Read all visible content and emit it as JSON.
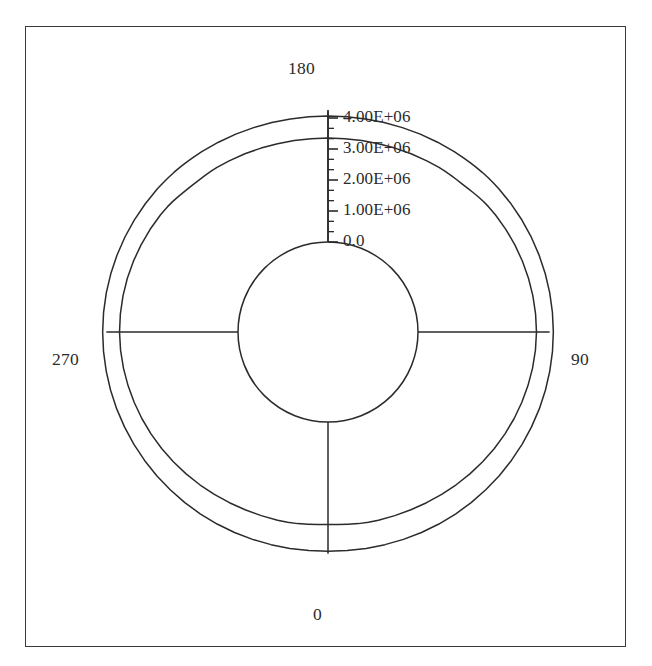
{
  "figure": {
    "type": "polar-plot",
    "background_color": "#ffffff",
    "line_color": "#2b2b2b",
    "frame_color": "#3a3a3a",
    "width": 652,
    "height": 666
  },
  "angular_axis": {
    "labels": [
      {
        "name": "angle-0",
        "text": "0",
        "angle_deg": 0
      },
      {
        "name": "angle-90",
        "text": "90",
        "angle_deg": 90
      },
      {
        "name": "angle-180",
        "text": "180",
        "angle_deg": 180
      },
      {
        "name": "angle-270",
        "text": "270",
        "angle_deg": 270
      }
    ],
    "direction": "clockwise_from_bottom",
    "spoke_count": 4
  },
  "radial_axis": {
    "labels": [
      "0.0",
      "1.00E+06",
      "2.00E+06",
      "3.00E+06",
      "4.00E+06"
    ],
    "values": [
      0,
      1000000,
      2000000,
      3000000,
      4000000
    ],
    "tick_label_angle_deg": 180,
    "minor_ticks_per_interval": 2,
    "rlim": [
      0,
      4400000
    ],
    "inner_hole_value": 0
  },
  "chart_data": {
    "type": "line",
    "title": "",
    "xlabel": "",
    "ylabel": "",
    "coordinate_system": "polar",
    "theta_unit": "degrees",
    "theta_zero_location": "bottom",
    "theta_direction": "clockwise",
    "rlim": [
      0,
      4400000
    ],
    "rticks": [
      0,
      1000000,
      2000000,
      3000000,
      4000000
    ],
    "rtick_labels": [
      "0.0",
      "1.00E+06",
      "2.00E+06",
      "3.00E+06",
      "4.00E+06"
    ],
    "thetaticks": [
      0,
      90,
      180,
      270
    ],
    "thetatick_labels": [
      "0",
      "90",
      "180",
      "270"
    ],
    "grid": false,
    "legend": null,
    "series": [
      {
        "name": "outer-curve",
        "theta": [
          0,
          5,
          10,
          15,
          20,
          25,
          30,
          35,
          40,
          45,
          50,
          55,
          60,
          65,
          70,
          75,
          80,
          85,
          90,
          95,
          100,
          105,
          110,
          115,
          120,
          125,
          130,
          132,
          134,
          136,
          138,
          140,
          142,
          145,
          150,
          155,
          160,
          165,
          170,
          175,
          180,
          185,
          190,
          195,
          200,
          205,
          210,
          215,
          218,
          220,
          222,
          224,
          226,
          228,
          230,
          235,
          240,
          245,
          250,
          255,
          260,
          265,
          270,
          275,
          280,
          285,
          290,
          295,
          300,
          305,
          310,
          315,
          320,
          325,
          330,
          335,
          340,
          345,
          350,
          355,
          360
        ],
        "r": [
          4170000,
          4175000,
          4185000,
          4198000,
          4215000,
          4232000,
          4250000,
          4266000,
          4281000,
          4295000,
          4308000,
          4320000,
          4331000,
          4341000,
          4350000,
          4357000,
          4362000,
          4365000,
          4366000,
          4364000,
          4360000,
          4353000,
          4344000,
          4333000,
          4320000,
          4305000,
          4288000,
          4280000,
          4270000,
          4258000,
          4244000,
          4230000,
          4216000,
          4196000,
          4166000,
          4138000,
          4113000,
          4092000,
          4077000,
          4068000,
          4065000,
          4068000,
          4077000,
          4092000,
          4113000,
          4138000,
          4166000,
          4196000,
          4214000,
          4226000,
          4240000,
          4252000,
          4263000,
          4272000,
          4281000,
          4298000,
          4314000,
          4328000,
          4341000,
          4351000,
          4359000,
          4364000,
          4366000,
          4365000,
          4362000,
          4357000,
          4350000,
          4341000,
          4331000,
          4320000,
          4308000,
          4295000,
          4281000,
          4266000,
          4250000,
          4232000,
          4215000,
          4198000,
          4185000,
          4175000,
          4170000
        ]
      },
      {
        "name": "inner-curve",
        "theta": [
          0,
          3,
          6,
          9,
          12,
          15,
          20,
          25,
          30,
          35,
          40,
          45,
          50,
          55,
          60,
          65,
          70,
          75,
          80,
          85,
          90,
          95,
          100,
          105,
          110,
          115,
          120,
          125,
          128,
          130,
          132,
          134,
          136,
          138,
          140,
          142,
          144,
          146,
          150,
          155,
          160,
          165,
          170,
          175,
          180,
          185,
          190,
          195,
          200,
          205,
          210,
          214,
          216,
          218,
          220,
          222,
          224,
          226,
          228,
          230,
          232,
          235,
          240,
          245,
          250,
          255,
          260,
          265,
          270,
          275,
          280,
          285,
          290,
          295,
          300,
          305,
          310,
          315,
          320,
          325,
          330,
          335,
          340,
          345,
          348,
          351,
          354,
          357,
          360
        ],
        "r": [
          3310000,
          3318000,
          3330000,
          3355000,
          3372000,
          3382000,
          3400000,
          3425000,
          3455000,
          3490000,
          3530000,
          3570000,
          3610000,
          3648000,
          3684000,
          3718000,
          3748000,
          3775000,
          3797000,
          3814000,
          3822000,
          3818000,
          3808000,
          3792000,
          3772000,
          3748000,
          3720000,
          3688000,
          3665000,
          3645000,
          3618000,
          3588000,
          3560000,
          3540000,
          3528000,
          3520000,
          3512000,
          3500000,
          3472000,
          3440000,
          3410000,
          3386000,
          3368000,
          3357000,
          3353000,
          3357000,
          3368000,
          3386000,
          3410000,
          3440000,
          3472000,
          3500000,
          3510000,
          3518000,
          3526000,
          3538000,
          3556000,
          3580000,
          3610000,
          3640000,
          3665000,
          3690000,
          3722000,
          3750000,
          3776000,
          3798000,
          3812000,
          3820000,
          3822000,
          3814000,
          3797000,
          3775000,
          3748000,
          3718000,
          3684000,
          3648000,
          3610000,
          3570000,
          3530000,
          3490000,
          3455000,
          3425000,
          3400000,
          3382000,
          3372000,
          3355000,
          3330000,
          3318000,
          3310000
        ]
      }
    ]
  },
  "geometry": {
    "center_x": 328,
    "center_y": 332,
    "r0_pixels": 90,
    "pixels_per_unit": 3.1e-05
  }
}
